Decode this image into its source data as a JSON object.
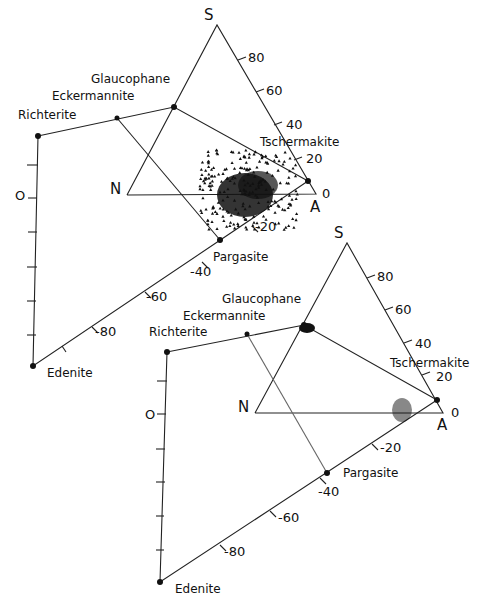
{
  "diagrams": [
    {
      "id": "upper",
      "labels": {
        "S": "S",
        "N": "N",
        "A": "A",
        "glaucophane": "Glaucophane",
        "eckermannite": "Eckermannite",
        "richterite": "Richterite",
        "tschermakite": "Tschermakite",
        "pargasite": "Pargasite",
        "edenite": "Edenite",
        "zero_left": "O",
        "zero_right": "0"
      },
      "right_axis_ticks": [
        "80",
        "60",
        "40",
        "20"
      ],
      "lower_axis_ticks": [
        "-20",
        "-40",
        "-60",
        "-80"
      ],
      "marker": "triangle"
    },
    {
      "id": "lower",
      "labels": {
        "S": "S",
        "N": "N",
        "A": "A",
        "glaucophane": "Glaucophane",
        "eckermannite": "Eckermannite",
        "richterite": "Richterite",
        "tschermakite": "Tschermakite",
        "pargasite": "Pargasite",
        "edenite": "Edenite",
        "zero_left": "O",
        "zero_right": "0"
      },
      "right_axis_ticks": [
        "80",
        "60",
        "40",
        "20"
      ],
      "lower_axis_ticks": [
        "-20",
        "-40",
        "-60",
        "-80"
      ],
      "marker": "inverted-triangle-and-square"
    }
  ]
}
